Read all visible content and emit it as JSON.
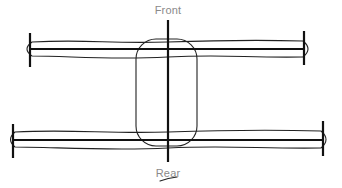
{
  "diagram": {
    "labels": {
      "front": "Front",
      "rear": "Rear"
    },
    "colors": {
      "stroke": "#111111",
      "label": "#8a8a8a",
      "background": "#ffffff"
    },
    "front_label_pos": {
      "x": 168,
      "y": 4
    },
    "rear_label_pos": {
      "x": 168,
      "y": 167
    },
    "center_axis": {
      "x": 168,
      "y1": 20,
      "y2": 162
    },
    "body": {
      "x": 136,
      "y": 39,
      "width": 61,
      "height": 107,
      "radius": 20
    },
    "front_axle": {
      "y": 49,
      "x1": 30,
      "x2": 305,
      "left_tick": {
        "x": 30,
        "y1": 33,
        "y2": 67
      },
      "right_tick": {
        "x": 304,
        "y1": 31,
        "y2": 65
      },
      "tube": {
        "left": 24,
        "right": 311,
        "top": 41,
        "bottom": 57
      }
    },
    "rear_axle": {
      "y": 140,
      "x1": 13,
      "x2": 323,
      "left_tick": {
        "x": 13,
        "y1": 124,
        "y2": 158
      },
      "right_tick": {
        "x": 323,
        "y1": 121,
        "y2": 156
      },
      "tube": {
        "left": 8,
        "right": 329,
        "top": 131,
        "bottom": 148
      }
    }
  }
}
